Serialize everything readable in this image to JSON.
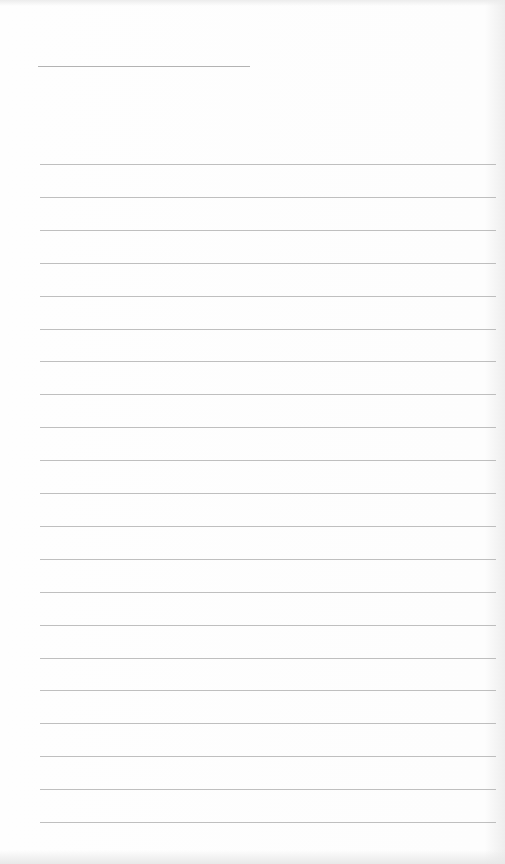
{
  "document": {
    "type": "ruled writing sheet",
    "header_line": {
      "left": 38,
      "top": 66,
      "width": 212
    },
    "lines": {
      "count": 21,
      "left": 40,
      "right": 496,
      "first_top": 164,
      "spacing": 32.9
    },
    "colors": {
      "paper": "#fdfdfd",
      "rule": "#a9a9a9"
    }
  }
}
